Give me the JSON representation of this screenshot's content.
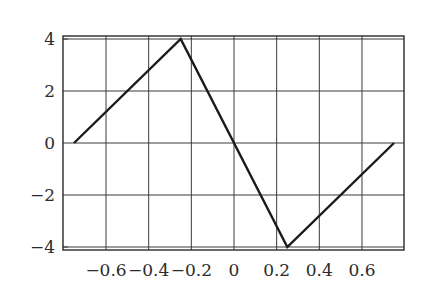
{
  "chart_data": {
    "type": "line",
    "title": "",
    "xlabel": "",
    "ylabel": "",
    "xlim": [
      -0.8,
      0.8
    ],
    "ylim": [
      -4.1,
      4.1
    ],
    "grid": true,
    "legend": null,
    "x_ticks": [
      -0.6,
      -0.4,
      -0.2,
      0,
      0.2,
      0.4,
      0.6
    ],
    "x_tick_labels": [
      "−0.6",
      "−0.4",
      "−0.2",
      "0",
      "0.2",
      "0.4",
      "0.6"
    ],
    "y_ticks": [
      4,
      2,
      0,
      -2,
      -4
    ],
    "y_tick_labels": [
      "4",
      "2",
      "0",
      "−2",
      "−4"
    ],
    "series": [
      {
        "name": "waveform",
        "color": "#1a1a1a",
        "x": [
          -0.75,
          -0.25,
          0.25,
          0.75
        ],
        "y": [
          0,
          4,
          -4,
          0
        ]
      }
    ]
  },
  "layout": {
    "origin_px": [
      234,
      143
    ],
    "x_px_per_unit": 213.3,
    "y_px_per_unit": 26,
    "frame": {
      "left": 63,
      "right": 404,
      "top": 36,
      "bottom": 250
    }
  }
}
